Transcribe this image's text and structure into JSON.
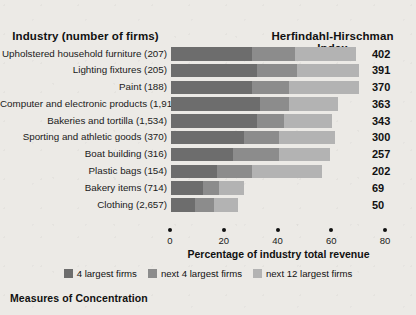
{
  "header": {
    "industry_label": "Industry (number of firms)",
    "hhi_label": "Herfindahl-Hirschman Index"
  },
  "caption": "Measures of Concentration",
  "colors": {
    "background": "#eceae6",
    "seg_4_largest": "#6d6d6d",
    "seg_next_4": "#8c8c8c",
    "seg_next_12": "#b3b3b3"
  },
  "legend": [
    {
      "label": "4 largest firms",
      "color": "#6d6d6d",
      "name": "legend-4-largest"
    },
    {
      "label": "next 4 largest firms",
      "color": "#8c8c8c",
      "name": "legend-next-4"
    },
    {
      "label": "next 12 largest firms",
      "color": "#b3b3b3",
      "name": "legend-next-12"
    }
  ],
  "chart_data": {
    "type": "bar",
    "orientation": "horizontal",
    "stacked": true,
    "title": "Measures of Concentration",
    "xlabel": "Percentage of industry total revenue",
    "ylabel": "Industry (number of firms)",
    "xlim": [
      0,
      80
    ],
    "xticks": [
      0,
      20,
      40,
      60,
      80
    ],
    "xticklabels": [
      "0",
      "20",
      "40",
      "60",
      "80"
    ],
    "grid": false,
    "legend_position": "bottom-center",
    "series": [
      {
        "name": "4 largest firms",
        "color": "#6d6d6d",
        "values": [
          30,
          32,
          30,
          33,
          32,
          27,
          23,
          17,
          12,
          9
        ]
      },
      {
        "name": "next 4 largest firms",
        "color": "#8c8c8c",
        "values": [
          16,
          15,
          14,
          11,
          10,
          13,
          17,
          13,
          6,
          7
        ]
      },
      {
        "name": "next 12 largest firms",
        "color": "#b3b3b3",
        "values": [
          23,
          23,
          26,
          18,
          18,
          21,
          19,
          26,
          9,
          9
        ]
      }
    ],
    "categories": [
      "Upholstered household furniture  (207)",
      "Lighting fixtures  (205)",
      "Paint  (188)",
      "Computer and electronic products  (1,915)",
      "Bakeries and tortilla  (1,534)",
      "Sporting and athletic goods  (370)",
      "Boat building  (316)",
      "Plastic bags  (154)",
      "Bakery items  (714)",
      "Clothing  (2,657)"
    ],
    "rows": [
      {
        "industry": "Upholstered household furniture",
        "firms": "(207)",
        "label": "Upholstered household furniture  (207)",
        "hhi": 402,
        "s1": 30,
        "s2": 16,
        "s3": 23
      },
      {
        "industry": "Lighting fixtures",
        "firms": "(205)",
        "label": "Lighting fixtures  (205)",
        "hhi": 391,
        "s1": 32,
        "s2": 15,
        "s3": 23
      },
      {
        "industry": "Paint",
        "firms": "(188)",
        "label": "Paint  (188)",
        "hhi": 370,
        "s1": 30,
        "s2": 14,
        "s3": 26
      },
      {
        "industry": "Computer and electronic products",
        "firms": "(1,915)",
        "label": "Computer and electronic products  (1,915)",
        "hhi": 363,
        "s1": 33,
        "s2": 11,
        "s3": 18
      },
      {
        "industry": "Bakeries and tortilla",
        "firms": "(1,534)",
        "label": "Bakeries and tortilla  (1,534)",
        "hhi": 343,
        "s1": 32,
        "s2": 10,
        "s3": 18
      },
      {
        "industry": "Sporting and athletic goods",
        "firms": "(370)",
        "label": "Sporting and athletic goods  (370)",
        "hhi": 300,
        "s1": 27,
        "s2": 13,
        "s3": 21
      },
      {
        "industry": "Boat building",
        "firms": "(316)",
        "label": "Boat building  (316)",
        "hhi": 257,
        "s1": 23,
        "s2": 17,
        "s3": 19
      },
      {
        "industry": "Plastic bags",
        "firms": "(154)",
        "label": "Plastic bags  (154)",
        "hhi": 202,
        "s1": 17,
        "s2": 13,
        "s3": 26
      },
      {
        "industry": "Bakery items",
        "firms": "(714)",
        "label": "Bakery items  (714)",
        "hhi": 69,
        "s1": 12,
        "s2": 6,
        "s3": 9
      },
      {
        "industry": "Clothing",
        "firms": "(2,657)",
        "label": "Clothing  (2,657)",
        "hhi": 50,
        "s1": 9,
        "s2": 7,
        "s3": 9
      }
    ]
  }
}
